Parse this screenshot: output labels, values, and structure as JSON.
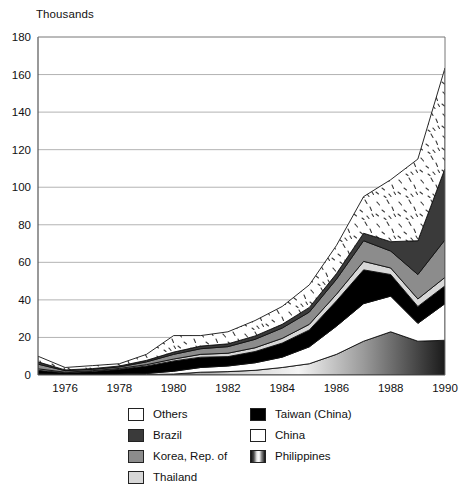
{
  "unit_label": "Thousands",
  "legend": {
    "left_column": [
      {
        "key": "others",
        "label": "Others",
        "swatch": "stipple-white"
      },
      {
        "key": "brazil",
        "label": "Brazil",
        "swatch": "dark-gray"
      },
      {
        "key": "korea",
        "label": "Korea, Rep. of",
        "swatch": "mid-gray"
      },
      {
        "key": "thailand",
        "label": "Thailand",
        "swatch": "light-gray"
      }
    ],
    "right_column": [
      {
        "key": "taiwan",
        "label": "Taiwan (China)",
        "swatch": "black"
      },
      {
        "key": "china",
        "label": "China",
        "swatch": "white"
      },
      {
        "key": "philippines",
        "label": "Philippines",
        "swatch": "vertical-gradient"
      }
    ]
  },
  "colors": {
    "others": "#ffffff",
    "brazil": "#3a3a3a",
    "korea": "#8c8c8c",
    "thailand": "#d7d7d7",
    "taiwan": "#000000",
    "china": "#ffffff",
    "philippines": "#b0b0b0",
    "axis": "#555555",
    "grid": "#aaaaaa",
    "text": "#111111"
  },
  "chart_data": {
    "type": "area",
    "title": "",
    "subtitle": "",
    "xlabel": "",
    "ylabel": "Thousands",
    "ylim": [
      0,
      180
    ],
    "xlim": [
      1975,
      1990
    ],
    "grid": true,
    "stacked": true,
    "legend_position": "bottom",
    "y_ticks": [
      0,
      20,
      40,
      60,
      80,
      100,
      120,
      140,
      160,
      180
    ],
    "x_ticks": [
      1976,
      1978,
      1980,
      1982,
      1984,
      1986,
      1988,
      1990
    ],
    "x": [
      1975,
      1976,
      1977,
      1978,
      1979,
      1980,
      1981,
      1982,
      1983,
      1984,
      1985,
      1986,
      1987,
      1988,
      1989,
      1990
    ],
    "stack_order_bottom_to_top": [
      "philippines",
      "china",
      "taiwan",
      "thailand",
      "korea",
      "brazil",
      "others"
    ],
    "series": [
      {
        "name": "Philippines",
        "key": "philippines",
        "values": [
          0.4,
          0.2,
          0.2,
          0.2,
          0.3,
          0.5,
          1.5,
          1.8,
          2.5,
          4.0,
          6.0,
          11.0,
          18.0,
          23.0,
          18.0,
          18.5
        ]
      },
      {
        "name": "China",
        "key": "china",
        "values": [
          0.3,
          0.2,
          0.2,
          0.3,
          0.5,
          1.5,
          2.5,
          3.0,
          4.0,
          5.5,
          9.0,
          15.0,
          20.0,
          19.0,
          9.5,
          19.5
        ]
      },
      {
        "name": "Taiwan (China)",
        "key": "taiwan",
        "values": [
          1.8,
          0.8,
          1.5,
          2.5,
          4.0,
          5.5,
          5.5,
          5.0,
          6.0,
          7.5,
          9.0,
          13.5,
          18.0,
          11.5,
          9.0,
          9.5
        ]
      },
      {
        "name": "Thailand",
        "key": "thailand",
        "values": [
          0.8,
          0.3,
          0.4,
          0.5,
          0.7,
          1.0,
          1.5,
          1.8,
          2.0,
          2.5,
          3.0,
          3.5,
          4.5,
          3.5,
          4.0,
          4.5
        ]
      },
      {
        "name": "Korea, Rep. of",
        "key": "korea",
        "values": [
          2.5,
          0.8,
          0.7,
          0.8,
          1.5,
          2.5,
          3.0,
          3.5,
          4.5,
          5.5,
          6.5,
          8.0,
          11.0,
          9.0,
          13.0,
          20.0
        ]
      },
      {
        "name": "Brazil",
        "key": "brazil",
        "values": [
          1.2,
          0.4,
          0.4,
          0.5,
          0.8,
          1.2,
          1.4,
          1.5,
          1.8,
          2.0,
          2.5,
          3.0,
          4.0,
          5.0,
          18.0,
          38.0
        ]
      },
      {
        "name": "Others",
        "key": "others",
        "values": [
          3.0,
          1.3,
          1.6,
          1.2,
          3.2,
          8.8,
          5.6,
          6.4,
          8.2,
          9.5,
          12.0,
          15.0,
          19.5,
          33.0,
          43.5,
          53.5
        ]
      }
    ],
    "totals": [
      10.0,
      4.0,
      5.0,
      6.0,
      11.0,
      21.0,
      21.0,
      23.0,
      29.0,
      36.5,
      48.0,
      69.0,
      95.0,
      104.0,
      115.0,
      163.5
    ]
  }
}
